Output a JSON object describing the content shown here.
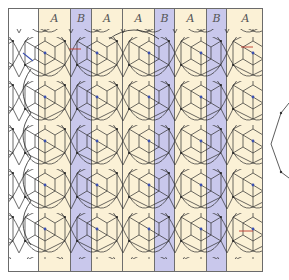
{
  "figure": {
    "title": "",
    "columns": [
      {
        "type": "W",
        "label": "",
        "x": 0,
        "width": 30
      },
      {
        "type": "A",
        "label": "A",
        "x": 30,
        "width": 32
      },
      {
        "type": "B",
        "label": "B",
        "x": 62,
        "width": 21
      },
      {
        "type": "A",
        "label": "A",
        "x": 83,
        "width": 31
      },
      {
        "type": "A",
        "label": "A",
        "x": 114,
        "width": 32
      },
      {
        "type": "B",
        "label": "B",
        "x": 146,
        "width": 20
      },
      {
        "type": "A",
        "label": "A",
        "x": 166,
        "width": 32
      },
      {
        "type": "B",
        "label": "B",
        "x": 198,
        "width": 20
      },
      {
        "type": "A",
        "label": "A",
        "x": 218,
        "width": 37
      }
    ],
    "colors": {
      "A": "#fbf1d6",
      "B": "#c9c8ec",
      "line": "#2a2a2a",
      "accent_red": "#c0392b",
      "accent_blue": "#3a4fb0"
    },
    "side_shape": "partial-hexagon-outline"
  }
}
